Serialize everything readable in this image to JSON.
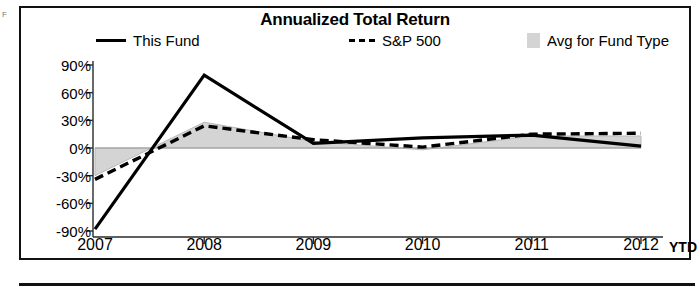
{
  "chart_data": {
    "type": "line",
    "title": "Annualized Total Return",
    "xlabel": "YTD",
    "ylabel": "",
    "categories": [
      "2007",
      "2008",
      "2009",
      "2010",
      "2011",
      "2012"
    ],
    "x_unit_label": "YTD",
    "ytick_labels": [
      "90%",
      "60%",
      "30%",
      "0%",
      "-30%",
      "-60%",
      "-90%"
    ],
    "ytick_values": [
      90,
      60,
      30,
      0,
      -30,
      -60,
      -90
    ],
    "ylim": [
      -90,
      90
    ],
    "grid": false,
    "legend_position": "top",
    "series": [
      {
        "name": "This Fund",
        "style": "solid",
        "color": "#000000",
        "values": [
          -88,
          79,
          5,
          11,
          14,
          2
        ]
      },
      {
        "name": "S&P 500",
        "style": "dashed",
        "color": "#000000",
        "values": [
          -34,
          24,
          9,
          1,
          15,
          16
        ]
      },
      {
        "name": "Avg for Fund Type",
        "style": "area",
        "color": "#d4d4d4",
        "values": [
          -30,
          28,
          7,
          -2,
          13,
          13
        ]
      }
    ]
  },
  "legend": {
    "fund_label": "This Fund",
    "sp_label": "S&P 500",
    "avg_label": "Avg for Fund Type"
  },
  "edge": {
    "artifact_text": "F"
  }
}
